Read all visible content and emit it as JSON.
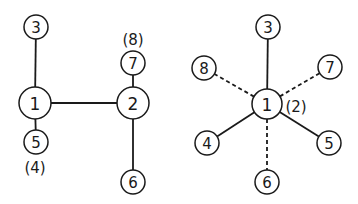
{
  "diagrams": [
    {
      "id": "left",
      "nodes": [
        {
          "label": "3",
          "x": 36,
          "y": 27,
          "r": 12
        },
        {
          "label": "1",
          "x": 35,
          "y": 103,
          "r": 16
        },
        {
          "label": "5",
          "x": 36,
          "y": 142,
          "r": 12
        },
        {
          "label": "2",
          "x": 133,
          "y": 103,
          "r": 16
        },
        {
          "label": "7",
          "x": 133,
          "y": 63,
          "r": 12
        },
        {
          "label": "6",
          "x": 133,
          "y": 182,
          "r": 12
        }
      ],
      "edges": [
        {
          "from": "1",
          "to": "3",
          "style": "solid"
        },
        {
          "from": "1",
          "to": "5",
          "style": "solid"
        },
        {
          "from": "1",
          "to": "2",
          "style": "solid"
        },
        {
          "from": "2",
          "to": "7",
          "style": "solid"
        },
        {
          "from": "2",
          "to": "6",
          "style": "solid"
        }
      ],
      "annotations": [
        {
          "text": "(4)",
          "x": 35,
          "y": 168
        },
        {
          "text": "(8)",
          "x": 133,
          "y": 40
        }
      ]
    },
    {
      "id": "right",
      "nodes": [
        {
          "label": "3",
          "x": 268,
          "y": 27,
          "r": 12
        },
        {
          "label": "8",
          "x": 204,
          "y": 68,
          "r": 12
        },
        {
          "label": "7",
          "x": 330,
          "y": 67,
          "r": 12
        },
        {
          "label": "1",
          "x": 267,
          "y": 104,
          "r": 15
        },
        {
          "label": "4",
          "x": 207,
          "y": 143,
          "r": 12
        },
        {
          "label": "5",
          "x": 329,
          "y": 143,
          "r": 12
        },
        {
          "label": "6",
          "x": 267,
          "y": 182,
          "r": 12
        }
      ],
      "edges": [
        {
          "from": "1",
          "to": "3",
          "style": "solid"
        },
        {
          "from": "1",
          "to": "4",
          "style": "solid"
        },
        {
          "from": "1",
          "to": "5",
          "style": "solid"
        },
        {
          "from": "1",
          "to": "8",
          "style": "dashed"
        },
        {
          "from": "1",
          "to": "7",
          "style": "dashed"
        },
        {
          "from": "1",
          "to": "6",
          "style": "dashed"
        }
      ],
      "annotations": [
        {
          "text": "(2)",
          "x": 296,
          "y": 107
        }
      ]
    }
  ]
}
